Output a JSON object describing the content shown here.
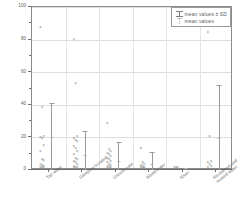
{
  "chart_data": {
    "type": "scatter",
    "title": "",
    "xlabel": "",
    "ylabel": "EC(mS/m)",
    "ylim": [
      0,
      100
    ],
    "yticks": [
      0,
      20,
      40,
      60,
      80,
      100
    ],
    "ytick_labels": [
      "0",
      "20",
      "40",
      "60",
      "80",
      "100"
    ],
    "grid": true,
    "legend_position": "top-right",
    "categories": [
      "Tap water",
      "Sampling location",
      "Greenhouse",
      "Wastewater",
      "River",
      "Reclaimed and reused water"
    ],
    "series": [
      {
        "name": "mean values ± SD",
        "type": "errorbar",
        "means": [
          20.0,
          9.0,
          5.5,
          3.5,
          1.0,
          19.5
        ],
        "sd_upper": [
          41.0,
          24.0,
          17.0,
          11.0,
          1.5,
          52.0
        ]
      },
      {
        "name": "mean values",
        "type": "marker",
        "values": [
          20.0,
          9.0,
          5.5,
          3.5,
          1.0,
          19.5
        ]
      }
    ],
    "observations": [
      {
        "category": "Tap water",
        "values": [
          87.0,
          38.0,
          20.5,
          19.5,
          19.0,
          14.5,
          11.0,
          6.0,
          5.5,
          3.0,
          2.5,
          2.0,
          1.5,
          1.0,
          0.5
        ]
      },
      {
        "category": "Sampling location",
        "values": [
          80.0,
          53.0,
          20.0,
          19.0,
          18.0,
          17.0,
          14.0,
          13.0,
          11.0,
          9.0,
          7.0,
          6.0,
          5.0,
          4.0,
          3.0,
          2.0,
          1.5,
          1.0,
          0.5
        ]
      },
      {
        "category": "Greenhouse",
        "values": [
          28.0,
          12.0,
          11.0,
          10.0,
          9.0,
          8.0,
          7.0,
          6.0,
          5.0,
          4.0,
          3.0,
          2.5,
          2.0,
          1.5,
          1.0,
          0.5
        ]
      },
      {
        "category": "Wastewater",
        "values": [
          13.0,
          4.0,
          3.0,
          2.5,
          2.0,
          1.5,
          1.0,
          0.8,
          0.5
        ]
      },
      {
        "category": "River",
        "values": [
          1.5,
          1.2,
          1.0
        ]
      },
      {
        "category": "Reclaimed and reused water",
        "values": [
          84.0,
          20.0,
          5.0,
          4.0,
          3.0,
          2.0,
          1.0
        ]
      }
    ],
    "legend": [
      {
        "label": "mean values ±  SD",
        "symbol": "errorbar-icon"
      },
      {
        "label": "mean values",
        "symbol": "mean-marker-icon"
      }
    ]
  }
}
